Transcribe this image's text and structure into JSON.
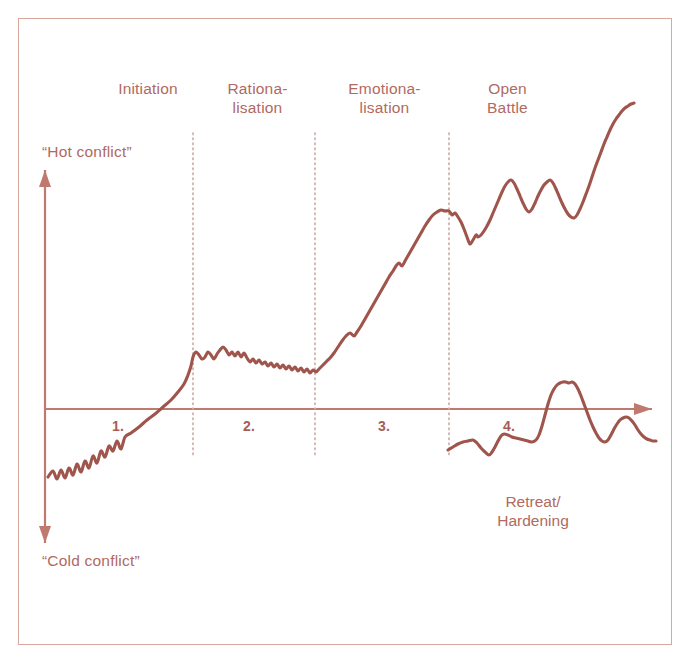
{
  "figure": {
    "title_alt": "Conflict escalation curve",
    "background_color": "#ffffff",
    "frame_color": "#d9a79e",
    "ink_color": "#a75d54",
    "curve_color": "#a0554c",
    "text_color": "#b06a61",
    "axis_color": "#c0796e",
    "divider_color": "#c9a9a2"
  },
  "axis": {
    "top_label": "“Hot conflict”",
    "bottom_label": "“Cold conflict”",
    "vertical_axis_name": "conflict-intensity-axis",
    "horizontal_axis_name": "time-axis"
  },
  "phases": [
    {
      "number": "1.",
      "label": "Initiation"
    },
    {
      "number": "2.",
      "label": "Rationa-\nlisation"
    },
    {
      "number": "3.",
      "label": "Emotiona-\nlisation"
    },
    {
      "number": "4.",
      "label": "Open\nBattle"
    }
  ],
  "branches": [
    {
      "label": "Retreat/\nHardening"
    }
  ],
  "caption": "",
  "chart_data": {
    "type": "line",
    "title": "",
    "xlabel": "",
    "ylabel": "",
    "xlim": [
      0,
      691
    ],
    "ylim": [
      669,
      0
    ],
    "grid": false,
    "legend": "none",
    "axis_baseline_y": 409,
    "axis_origin_x": 45,
    "axis_arrow_top_y": 170,
    "axis_arrow_bottom_y": 543,
    "axis_arrow_right_x": 652,
    "dividers_x": [
      193,
      315,
      449
    ],
    "divider_top_y": 133,
    "divider_bottom_y": 455,
    "phase_bounds_x": [
      48,
      193,
      315,
      449,
      652
    ],
    "series": [
      {
        "name": "main-escalation-curve",
        "points": [
          [
            48,
            477
          ],
          [
            53,
            471
          ],
          [
            57,
            479
          ],
          [
            61,
            470
          ],
          [
            65,
            478
          ],
          [
            69,
            468
          ],
          [
            73,
            475
          ],
          [
            77,
            464
          ],
          [
            81,
            472
          ],
          [
            85,
            461
          ],
          [
            89,
            468
          ],
          [
            93,
            456
          ],
          [
            97,
            463
          ],
          [
            101,
            451
          ],
          [
            105,
            457
          ],
          [
            109,
            446
          ],
          [
            113,
            451
          ],
          [
            117,
            441
          ],
          [
            121,
            449
          ],
          [
            125,
            437
          ],
          [
            131,
            433
          ],
          [
            139,
            427
          ],
          [
            147,
            420
          ],
          [
            155,
            414
          ],
          [
            163,
            407
          ],
          [
            171,
            400
          ],
          [
            178,
            392
          ],
          [
            184,
            384
          ],
          [
            188,
            375
          ],
          [
            191,
            366
          ],
          [
            193,
            357
          ],
          [
            196,
            352
          ],
          [
            199,
            355
          ],
          [
            202,
            359
          ],
          [
            205,
            357
          ],
          [
            208,
            352
          ],
          [
            211,
            355
          ],
          [
            214,
            359
          ],
          [
            217,
            354
          ],
          [
            220,
            350
          ],
          [
            223,
            347
          ],
          [
            226,
            350
          ],
          [
            229,
            355
          ],
          [
            232,
            352
          ],
          [
            235,
            356
          ],
          [
            238,
            352
          ],
          [
            241,
            357
          ],
          [
            244,
            353
          ],
          [
            247,
            358
          ],
          [
            250,
            362
          ],
          [
            253,
            359
          ],
          [
            256,
            363
          ],
          [
            259,
            360
          ],
          [
            262,
            364
          ],
          [
            265,
            362
          ],
          [
            268,
            366
          ],
          [
            271,
            363
          ],
          [
            274,
            367
          ],
          [
            277,
            364
          ],
          [
            280,
            368
          ],
          [
            283,
            365
          ],
          [
            286,
            369
          ],
          [
            289,
            366
          ],
          [
            292,
            370
          ],
          [
            295,
            367
          ],
          [
            298,
            371
          ],
          [
            301,
            368
          ],
          [
            304,
            372
          ],
          [
            307,
            369
          ],
          [
            310,
            373
          ],
          [
            313,
            370
          ],
          [
            316,
            372
          ],
          [
            319,
            369
          ],
          [
            322,
            366
          ],
          [
            326,
            362
          ],
          [
            330,
            358
          ],
          [
            334,
            353
          ],
          [
            338,
            347
          ],
          [
            342,
            341
          ],
          [
            346,
            336
          ],
          [
            350,
            333
          ],
          [
            354,
            336
          ],
          [
            357,
            332
          ],
          [
            361,
            326
          ],
          [
            365,
            319
          ],
          [
            369,
            312
          ],
          [
            373,
            305
          ],
          [
            377,
            298
          ],
          [
            381,
            291
          ],
          [
            385,
            284
          ],
          [
            389,
            277
          ],
          [
            393,
            271
          ],
          [
            396,
            266
          ],
          [
            399,
            263
          ],
          [
            402,
            266
          ],
          [
            405,
            261
          ],
          [
            409,
            254
          ],
          [
            413,
            247
          ],
          [
            417,
            240
          ],
          [
            421,
            233
          ],
          [
            425,
            226
          ],
          [
            429,
            220
          ],
          [
            433,
            215
          ],
          [
            437,
            212
          ],
          [
            441,
            210
          ],
          [
            445,
            211
          ],
          [
            449,
            211
          ],
          [
            452,
            215
          ],
          [
            455,
            213
          ],
          [
            458,
            217
          ],
          [
            461,
            222
          ],
          [
            464,
            229
          ],
          [
            467,
            237
          ],
          [
            470,
            244
          ],
          [
            473,
            240
          ],
          [
            476,
            235
          ],
          [
            478,
            237
          ],
          [
            481,
            235
          ],
          [
            484,
            231
          ],
          [
            487,
            226
          ],
          [
            490,
            220
          ],
          [
            493,
            213
          ],
          [
            496,
            206
          ],
          [
            499,
            199
          ],
          [
            502,
            192
          ],
          [
            505,
            186
          ],
          [
            508,
            182
          ],
          [
            511,
            180
          ],
          [
            514,
            183
          ],
          [
            517,
            189
          ],
          [
            520,
            196
          ],
          [
            523,
            203
          ],
          [
            526,
            209
          ],
          [
            529,
            212
          ],
          [
            532,
            209
          ],
          [
            535,
            203
          ],
          [
            538,
            196
          ],
          [
            541,
            190
          ],
          [
            544,
            185
          ],
          [
            547,
            182
          ],
          [
            550,
            180
          ],
          [
            553,
            183
          ],
          [
            556,
            189
          ],
          [
            559,
            196
          ],
          [
            562,
            203
          ],
          [
            565,
            209
          ],
          [
            568,
            214
          ],
          [
            571,
            217
          ],
          [
            574,
            218
          ],
          [
            577,
            215
          ],
          [
            580,
            209
          ],
          [
            583,
            202
          ],
          [
            586,
            194
          ],
          [
            589,
            186
          ],
          [
            592,
            177
          ],
          [
            595,
            168
          ],
          [
            598,
            160
          ],
          [
            601,
            152
          ],
          [
            604,
            144
          ],
          [
            607,
            137
          ],
          [
            610,
            130
          ],
          [
            613,
            124
          ],
          [
            616,
            119
          ],
          [
            619,
            115
          ],
          [
            622,
            111
          ],
          [
            625,
            108
          ],
          [
            628,
            106
          ],
          [
            631,
            104
          ],
          [
            634,
            103
          ]
        ]
      },
      {
        "name": "retreat-hardening-curve",
        "points": [
          [
            448,
            450
          ],
          [
            453,
            447
          ],
          [
            458,
            444
          ],
          [
            463,
            442
          ],
          [
            468,
            441
          ],
          [
            473,
            440
          ],
          [
            477,
            443
          ],
          [
            481,
            448
          ],
          [
            485,
            452
          ],
          [
            489,
            455
          ],
          [
            492,
            452
          ],
          [
            495,
            447
          ],
          [
            498,
            441
          ],
          [
            501,
            436
          ],
          [
            504,
            434
          ],
          [
            508,
            435
          ],
          [
            512,
            437
          ],
          [
            516,
            438
          ],
          [
            520,
            439
          ],
          [
            524,
            440
          ],
          [
            528,
            441
          ],
          [
            532,
            442
          ],
          [
            536,
            440
          ],
          [
            539,
            435
          ],
          [
            542,
            426
          ],
          [
            545,
            415
          ],
          [
            548,
            404
          ],
          [
            551,
            395
          ],
          [
            554,
            389
          ],
          [
            557,
            385
          ],
          [
            560,
            383
          ],
          [
            563,
            382
          ],
          [
            566,
            382
          ],
          [
            569,
            383
          ],
          [
            572,
            382
          ],
          [
            575,
            384
          ],
          [
            578,
            389
          ],
          [
            581,
            396
          ],
          [
            584,
            404
          ],
          [
            587,
            412
          ],
          [
            590,
            420
          ],
          [
            593,
            427
          ],
          [
            596,
            433
          ],
          [
            599,
            438
          ],
          [
            602,
            441
          ],
          [
            605,
            442
          ],
          [
            608,
            440
          ],
          [
            611,
            435
          ],
          [
            614,
            429
          ],
          [
            617,
            424
          ],
          [
            620,
            420
          ],
          [
            623,
            418
          ],
          [
            626,
            417
          ],
          [
            629,
            418
          ],
          [
            632,
            421
          ],
          [
            635,
            425
          ],
          [
            638,
            430
          ],
          [
            641,
            434
          ],
          [
            644,
            437
          ],
          [
            647,
            439
          ],
          [
            650,
            440
          ],
          [
            653,
            441
          ],
          [
            656,
            441
          ]
        ]
      }
    ]
  },
  "labels_layout": {
    "phase_label_positions": [
      {
        "left": 88,
        "top": 80,
        "width": 120
      },
      {
        "left": 210,
        "top": 80,
        "width": 95
      },
      {
        "left": 332,
        "top": 80,
        "width": 105
      },
      {
        "left": 465,
        "top": 80,
        "width": 85
      }
    ],
    "phase_number_positions": [
      {
        "left": 112,
        "top": 418
      },
      {
        "left": 243,
        "top": 418
      },
      {
        "left": 378,
        "top": 418
      },
      {
        "left": 503,
        "top": 418
      }
    ],
    "hot_label": {
      "left": 42,
      "top": 143
    },
    "cold_label": {
      "left": 42,
      "top": 552
    },
    "branch_label": {
      "left": 478,
      "top": 493,
      "width": 110
    }
  }
}
